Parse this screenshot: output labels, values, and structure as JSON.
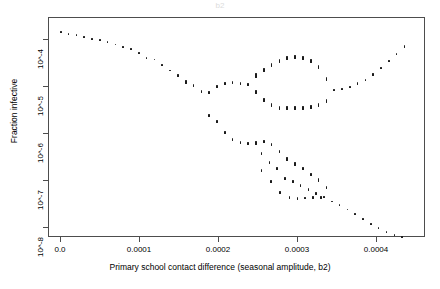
{
  "figure": {
    "title": "b2",
    "width": 440,
    "height": 289,
    "background": "#ffffff",
    "point_color": "#1a1a1a",
    "axis_color": "#4d4d4d"
  },
  "axes": {
    "y_title": "Fraction infective",
    "x_title": "Primary school contact difference (seasonal amplitude, b2)",
    "y_ticks": [
      "10^-8",
      "10^-7",
      "10^-6",
      "10^-5",
      "10^-4"
    ],
    "x_ticks": [
      "0.0",
      "0.0001",
      "0.0002",
      "0.0003",
      "0.0004"
    ]
  },
  "chart_data": {
    "type": "scatter",
    "title": "b2",
    "xlabel": "Primary school contact difference (seasonal amplitude, b2)",
    "ylabel": "Fraction infective",
    "xlim": [
      -1e-05,
      0.00047
    ],
    "ylim": [
      1e-08,
      0.0003
    ],
    "yscale": "log",
    "xscale": "linear",
    "grid": false,
    "legend": "none",
    "xtick_values": [
      0.0,
      0.0001,
      0.0002,
      0.0003,
      0.0004
    ],
    "xtick_labels": [
      "0.0",
      "0.0001",
      "0.0002",
      "0.0003",
      "0.0004"
    ],
    "ytick_values": [
      1e-08,
      1e-07,
      1e-06,
      1e-05,
      0.0001
    ],
    "ytick_labels": [
      "10^-8",
      "10^-7",
      "10^-6",
      "10^-5",
      "10^-4"
    ],
    "series": [
      {
        "name": "upper-branch",
        "note": "Main descending branch from 10^-4 at b2=0, falling to a local minimum then merging into the bubble.",
        "x": [
          5e-06,
          1.5e-05,
          2.5e-05,
          3.5e-05,
          4.5e-05,
          5.5e-05,
          6.5e-05,
          7.5e-05,
          8.5e-05,
          9.5e-05,
          0.000105,
          0.000115,
          0.000125,
          0.000135,
          0.000145,
          0.000155,
          0.000165,
          0.000175,
          0.000185,
          0.000195,
          0.000205,
          0.000215,
          0.000225,
          0.000235,
          0.000245,
          0.000255
        ],
        "y": [
          0.000155,
          0.000142,
          0.000133,
          0.000124,
          0.000113,
          0.000105,
          9.6e-05,
          8.6e-05,
          7.7e-05,
          6.8e-05,
          5.8e-05,
          4.6e-05,
          4.2e-05,
          3.3e-05,
          2.5e-05,
          2e-05,
          1.45e-05,
          1.25e-05,
          9.2e-06,
          9e-06,
          1.18e-05,
          1.35e-05,
          1.4e-05,
          1.38e-05,
          1.3e-05,
          1.9e-05
        ]
      },
      {
        "name": "bubble-upper",
        "note": "Upper arc of the closed loop / bubble centred near b2 = 0.0003.",
        "x": [
          0.000255,
          0.000265,
          0.000275,
          0.000285,
          0.000295,
          0.000305,
          0.000315,
          0.000325,
          0.000335,
          0.000345
        ],
        "y": [
          2.05e-05,
          2.6e-05,
          3.2e-05,
          4e-05,
          4.6e-05,
          4.8e-05,
          4.6e-05,
          3.9e-05,
          3e-05,
          1.65e-05
        ]
      },
      {
        "name": "bubble-lower",
        "note": "Lower arc of the closed loop / bubble.",
        "x": [
          0.000255,
          0.000265,
          0.000275,
          0.000285,
          0.000295,
          0.000305,
          0.000315,
          0.000325,
          0.000335,
          0.000345
        ],
        "y": [
          9e-06,
          6.2e-06,
          4.9e-06,
          4.3e-06,
          4.2e-06,
          4.2e-06,
          4.3e-06,
          4.4e-06,
          4.9e-06,
          6e-06
        ]
      },
      {
        "name": "right-branch",
        "note": "Single branch re-emerging after the bubble and rising toward 10^-4.",
        "x": [
          0.000355,
          0.000365,
          0.000375,
          0.000385,
          0.000395,
          0.000405,
          0.000415,
          0.000425,
          0.000435,
          0.000445
        ],
        "y": [
          1e-05,
          1.05e-05,
          1.15e-05,
          1.35e-05,
          1.6e-05,
          2.1e-05,
          2.8e-05,
          3.9e-05,
          5.5e-05,
          7.8e-05
        ]
      },
      {
        "name": "lower-descending-branch",
        "note": "Secondary branch descending steeply from the first bifurcation toward 10^-8.",
        "x": [
          0.000195,
          0.000205,
          0.000215,
          0.000225,
          0.000235,
          0.000245,
          0.000255,
          0.000262,
          0.000272,
          0.000282,
          0.000292,
          0.000302,
          0.000312,
          0.000322,
          0.000332,
          0.000342,
          0.000352,
          0.000362,
          0.000372,
          0.000382,
          0.000392,
          0.000402,
          0.000412,
          0.000422,
          0.000432,
          0.000442
        ],
        "y": [
          3e-06,
          2.2e-06,
          1.35e-06,
          9.5e-07,
          8.5e-07,
          8e-07,
          8.2e-07,
          5e-07,
          3.3e-07,
          2.4e-07,
          1.55e-07,
          1.3e-07,
          1.1e-07,
          9.2e-08,
          7.4e-08,
          6.2e-08,
          5.1e-08,
          4.3e-08,
          3.5e-08,
          2.8e-08,
          2.2e-08,
          1.8e-08,
          1.45e-08,
          1.22e-08,
          1.06e-08,
          9.5e-09
        ]
      },
      {
        "name": "lower-secondary-branch",
        "note": "Second lower branch separating after b2 ≈ 0.00025, re-merging near b2 ≈ 0.00035.",
        "x": [
          0.000255,
          0.000265,
          0.000275,
          0.000285,
          0.000295,
          0.000305,
          0.000315,
          0.000325,
          0.000335,
          0.000345
        ],
        "y": [
          8e-07,
          8.6e-07,
          7.5e-07,
          5.4e-07,
          3.8e-07,
          3e-07,
          2.4e-07,
          1.85e-07,
          1.4e-07,
          1e-07
        ]
      },
      {
        "name": "lower-tertiary-branch",
        "note": "Third narrow lower branch near 10^-7 between b2 ≈ 0.00026 and 0.00035.",
        "x": [
          0.000262,
          0.000274,
          0.000286,
          0.000298,
          0.000308,
          0.000318,
          0.000328,
          0.000338
        ],
        "y": [
          2.2e-07,
          1.3e-07,
          7.8e-08,
          6.2e-08,
          5.9e-08,
          6e-08,
          6.1e-08,
          6.2e-08
        ]
      }
    ]
  }
}
